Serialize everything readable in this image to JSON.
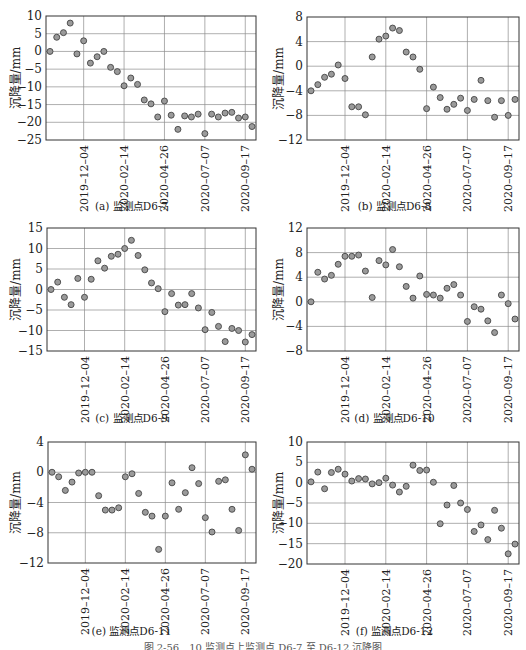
{
  "figure": {
    "caption": "图 2-56　10 监测点上监测点 D6-7 至 D6-12 沉降图"
  },
  "chart_data": [
    {
      "id": "a",
      "type": "scatter",
      "title": "(a) 监测点D6-7",
      "xlabel": "",
      "ylabel": "沉降量/mm",
      "ylim": [
        -25,
        10
      ],
      "yticks": [
        10,
        5,
        0,
        -5,
        -10,
        -15,
        -20,
        -25
      ],
      "xtick_labels": [
        "2019-12-04",
        "2020-02-14",
        "2020-04-26",
        "2020-07-07",
        "2020-09-17"
      ],
      "xtick_index": [
        5,
        11,
        17,
        23,
        29
      ],
      "grid": true,
      "values": [
        0,
        4,
        5.3,
        8,
        -0.7,
        3,
        -3.3,
        -1.5,
        0,
        -4.5,
        -5.7,
        -9.7,
        -7.5,
        -9.3,
        -13.7,
        -14.8,
        -18.5,
        -14,
        -18,
        -22,
        -18.2,
        -18.5,
        -17.7,
        -23.2,
        -17.7,
        -18.5,
        -17.4,
        -17.2,
        -18.8,
        -18.5,
        -21.2
      ]
    },
    {
      "id": "b",
      "type": "scatter",
      "title": "(b) 监测点D6-8",
      "xlabel": "",
      "ylabel": "沉降量/mm",
      "ylim": [
        -12,
        8
      ],
      "yticks": [
        8,
        4,
        0,
        -4,
        -8,
        -12
      ],
      "xtick_labels": [
        "2019-12-04",
        "2020-02-14",
        "2020-04-26",
        "2020-07-07",
        "2020-09-17"
      ],
      "xtick_index": [
        5,
        11,
        17,
        23,
        29
      ],
      "grid": true,
      "values": [
        -4,
        -3,
        -1.8,
        -1.3,
        0.2,
        -2,
        -6.6,
        -6.6,
        -7.9,
        1.5,
        4.4,
        4.9,
        6.2,
        5.8,
        2.3,
        1.5,
        -0.5,
        -6.9,
        -3.4,
        -5.1,
        -7,
        -6.2,
        -5.2,
        -7.2,
        -5.4,
        -2.3,
        -5.6,
        -8.3,
        -5.6,
        -8,
        -5.4
      ]
    },
    {
      "id": "c",
      "type": "scatter",
      "title": "(c) 监测点D6-9",
      "xlabel": "",
      "ylabel": "沉降量/mm",
      "ylim": [
        -15,
        15
      ],
      "yticks": [
        15,
        10,
        5,
        0,
        -5,
        -10,
        -15
      ],
      "xtick_labels": [
        "2019-12-04",
        "2020-02-14",
        "2020-04-26",
        "2020-07-07",
        "2020-09-17"
      ],
      "xtick_index": [
        5,
        11,
        17,
        23,
        29
      ],
      "grid": true,
      "values": [
        0,
        1.8,
        -1.9,
        -3.7,
        2.7,
        -1.9,
        2.5,
        7,
        5.2,
        8.1,
        8.6,
        10,
        12,
        8.3,
        4.8,
        1.6,
        0.2,
        -5.4,
        -1,
        -3.8,
        -3.7,
        -1,
        -4.5,
        -9.8,
        -5.6,
        -9,
        -12.7,
        -9.5,
        -10,
        -12.8,
        -11
      ]
    },
    {
      "id": "d",
      "type": "scatter",
      "title": "(d) 监测点D6-10",
      "xlabel": "",
      "ylabel": "沉降量/mm",
      "ylim": [
        -8,
        12
      ],
      "yticks": [
        12,
        8,
        4,
        0,
        -4,
        -8
      ],
      "xtick_labels": [
        "2019-12-04",
        "2020-02-14",
        "2020-04-26",
        "2020-07-07",
        "2020-09-17"
      ],
      "xtick_index": [
        5,
        11,
        17,
        23,
        29
      ],
      "grid": true,
      "values": [
        0,
        4.8,
        3.7,
        4.3,
        6.1,
        7.4,
        7.4,
        7.6,
        5,
        0.7,
        6.7,
        6,
        8.5,
        5.7,
        2.5,
        0.6,
        4.2,
        1.2,
        1.1,
        0.6,
        2.2,
        2.8,
        1.1,
        -3.2,
        -0.8,
        -1.2,
        -3.1,
        -5,
        1.1,
        -0.3,
        -2.8
      ]
    },
    {
      "id": "e",
      "type": "scatter",
      "title": "(e) 监测点D6-11",
      "xlabel": "",
      "ylabel": "沉降量/mm",
      "ylim": [
        -12,
        4
      ],
      "yticks": [
        4,
        0,
        -4,
        -8,
        -12
      ],
      "xtick_labels": [
        "2019-12-04",
        "2020-02-14",
        "2020-04-26",
        "2020-07-07",
        "2020-09-17"
      ],
      "xtick_index": [
        5,
        11,
        17,
        23,
        29
      ],
      "grid": true,
      "values": [
        0,
        -0.6,
        -2.4,
        -1.3,
        -0.1,
        0,
        0,
        -3.1,
        -5,
        -5,
        -4.7,
        -0.6,
        -0.2,
        -2.8,
        -5.3,
        -5.8,
        -10.2,
        -5.8,
        -1.4,
        -4.9,
        -2.7,
        0.6,
        -1.5,
        -6,
        -7.9,
        -1.2,
        -1,
        -4.9,
        -7.7,
        2.3,
        0.4
      ]
    },
    {
      "id": "f",
      "type": "scatter",
      "title": "(f) 监测点D6-12",
      "xlabel": "",
      "ylabel": "沉降量/mm",
      "ylim": [
        -20,
        10
      ],
      "yticks": [
        10,
        5,
        0,
        -5,
        -10,
        -15,
        -20
      ],
      "xtick_labels": [
        "2019-12-04",
        "2020-02-14",
        "2020-04-26",
        "2020-07-07",
        "2020-09-17"
      ],
      "xtick_index": [
        5,
        11,
        17,
        23,
        29
      ],
      "grid": true,
      "values": [
        0.2,
        2.6,
        -1.5,
        2.5,
        3.3,
        2.1,
        0.4,
        1,
        0.9,
        -0.3,
        0,
        1.1,
        -0.6,
        -2.3,
        -0.9,
        4.3,
        3,
        3.1,
        0.1,
        -10.1,
        -5.5,
        -0.7,
        -5,
        -6.6,
        -12,
        -10.4,
        -14,
        -6.8,
        -11.2,
        -17.5,
        -15.1
      ]
    }
  ],
  "colors": {
    "marker_fill": "#9a9a9a",
    "marker_stroke": "#444444",
    "grid": "#8c8c8c",
    "axis": "#333333"
  }
}
